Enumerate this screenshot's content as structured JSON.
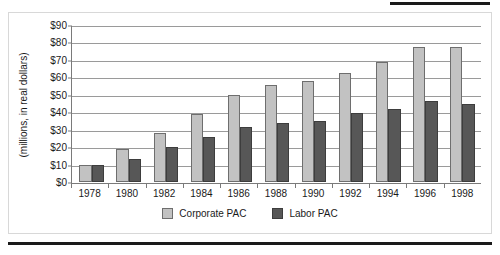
{
  "chart_data": {
    "type": "bar",
    "title": "",
    "xlabel": "",
    "ylabel": "(millions, in real dollars)",
    "ylim": [
      0,
      90
    ],
    "ytick_labels": [
      "$90",
      "$80",
      "$70",
      "$60",
      "$50",
      "$40",
      "$30",
      "$20",
      "$10",
      "$0"
    ],
    "ytick_values": [
      90,
      80,
      70,
      60,
      50,
      40,
      30,
      20,
      10,
      0
    ],
    "grid": true,
    "legend_position": "bottom",
    "categories": [
      "1978",
      "1980",
      "1982",
      "1984",
      "1986",
      "1988",
      "1990",
      "1992",
      "1994",
      "1996",
      "1998"
    ],
    "series": [
      {
        "name": "Corporate PAC",
        "color": "#c2c2c2",
        "values": [
          10,
          19,
          28,
          39,
          50,
          56,
          58,
          63,
          69,
          78,
          78
        ]
      },
      {
        "name": "Labor PAC",
        "color": "#575757",
        "values": [
          10,
          13,
          20,
          26,
          32,
          34,
          35,
          40,
          42,
          47,
          45
        ]
      }
    ]
  },
  "legend": {
    "items": [
      {
        "label": "Corporate PAC",
        "swatch": "corporate-swatch"
      },
      {
        "label": "Labor PAC",
        "swatch": "labor-swatch"
      }
    ]
  }
}
